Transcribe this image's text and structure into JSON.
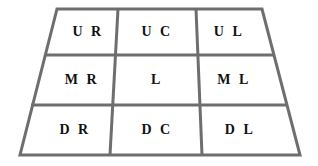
{
  "diagram": {
    "shape": "trapezoid",
    "rows": 3,
    "columns": 3,
    "line_color": "#6e6e6e",
    "line_width": 3,
    "background_color": "#ffffff",
    "text_color": "#111111",
    "outline": {
      "top_left": [
        57,
        9
      ],
      "top_right": [
        262,
        9
      ],
      "bottom_right": [
        300,
        155
      ],
      "bottom_left": [
        20,
        155
      ]
    },
    "horizontal_dividers": [
      {
        "left": [
          44,
          55
        ],
        "right": [
          275,
          55
        ]
      },
      {
        "left": [
          31,
          105
        ],
        "right": [
          288,
          105
        ]
      }
    ],
    "vertical_dividers": [
      {
        "top": [
          118,
          9
        ],
        "bottom": [
          110,
          155
        ]
      },
      {
        "top": [
          196,
          9
        ],
        "bottom": [
          202,
          155
        ]
      }
    ],
    "cells": [
      {
        "id": "upper-right",
        "label": "U R",
        "row": 0,
        "col": 0,
        "cx": 88,
        "cy": 32
      },
      {
        "id": "upper-center",
        "label": "U C",
        "row": 0,
        "col": 1,
        "cx": 157,
        "cy": 32
      },
      {
        "id": "upper-left",
        "label": "U L",
        "row": 0,
        "col": 2,
        "cx": 229,
        "cy": 32
      },
      {
        "id": "middle-right",
        "label": "M R",
        "row": 1,
        "col": 0,
        "cx": 82,
        "cy": 80
      },
      {
        "id": "center",
        "label": "L",
        "row": 1,
        "col": 1,
        "cx": 157,
        "cy": 80
      },
      {
        "id": "middle-left",
        "label": "M L",
        "row": 1,
        "col": 2,
        "cx": 234,
        "cy": 80
      },
      {
        "id": "down-right",
        "label": "D R",
        "row": 2,
        "col": 0,
        "cx": 75,
        "cy": 130
      },
      {
        "id": "down-center",
        "label": "D C",
        "row": 2,
        "col": 1,
        "cx": 157,
        "cy": 130
      },
      {
        "id": "down-left",
        "label": "D L",
        "row": 2,
        "col": 2,
        "cx": 240,
        "cy": 130
      }
    ]
  }
}
